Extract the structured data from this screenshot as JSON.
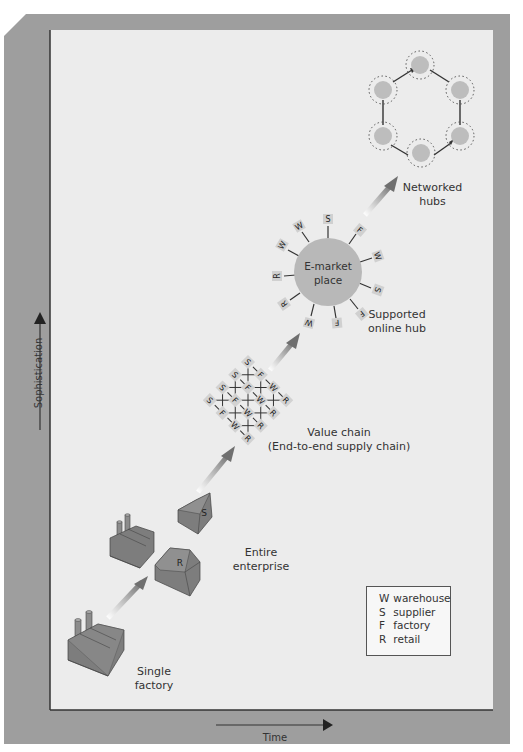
{
  "colors": {
    "frame": "#9e9e9e",
    "panel": "#ececec",
    "hub_fill": "#b9b9b9",
    "node_fill": "#cfcfcf",
    "building_top": "#8c8c8c",
    "building_side": "#6f6f6f",
    "arrow": "#7a7a7a",
    "text": "#333333"
  },
  "axes": {
    "y_label": "Sophistication",
    "x_label": "Time"
  },
  "stages": [
    {
      "id": "single-factory",
      "label_line1": "Single",
      "label_line2": "factory"
    },
    {
      "id": "entire-enterprise",
      "label_line1": "Entire",
      "label_line2": "enterprise"
    },
    {
      "id": "value-chain",
      "label_line1": "Value chain",
      "label_line2": "(End-to-end supply chain)"
    },
    {
      "id": "supported-online-hub",
      "label_line1": "Supported",
      "label_line2": "online hub"
    },
    {
      "id": "networked-hubs",
      "label_line1": "Networked",
      "label_line2": "hubs"
    }
  ],
  "buildings": {
    "retail_letter": "R",
    "supplier_letter": "S"
  },
  "emarket": {
    "line1": "E-market",
    "line2": "place",
    "spokes": [
      "S",
      "F",
      "W",
      "S",
      "F",
      "F",
      "W",
      "R",
      "R",
      "W",
      "W"
    ]
  },
  "value_chain_grid": {
    "rows": [
      [
        "S",
        "F",
        "W",
        "R"
      ],
      [
        "S",
        "F",
        "W",
        "R"
      ],
      [
        "S",
        "F",
        "W",
        "R"
      ],
      [
        "S",
        "F",
        "W",
        "R"
      ]
    ]
  },
  "network_hub_count": 6,
  "legend": {
    "items": [
      {
        "key": "W",
        "value": "warehouse"
      },
      {
        "key": "S",
        "value": "supplier"
      },
      {
        "key": "F",
        "value": "factory"
      },
      {
        "key": "R",
        "value": "retail"
      }
    ]
  }
}
